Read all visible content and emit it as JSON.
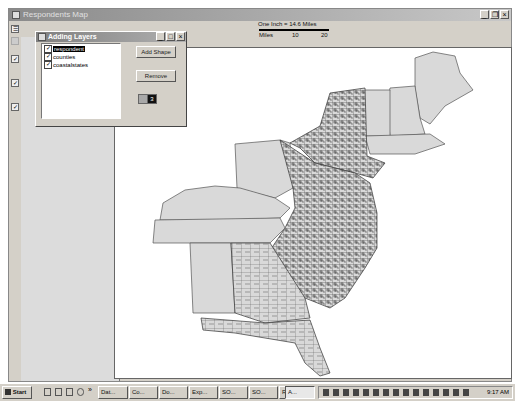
{
  "main_window": {
    "title": "Respondents Map",
    "controls": {
      "minimize": "_",
      "restore": "❐",
      "close": "×"
    }
  },
  "scale_bar": {
    "title": "One Inch = 14.6 Miles",
    "unit_label": "Miles",
    "ticks": [
      "10",
      "20"
    ]
  },
  "dialog": {
    "title": "Adding Layers",
    "controls": {
      "minimize": "_",
      "maximize": "□",
      "close": "×"
    },
    "layers": [
      {
        "label": "respondent",
        "checked": true,
        "selected": true
      },
      {
        "label": "counties",
        "checked": true,
        "selected": false
      },
      {
        "label": "coastalstates",
        "checked": true,
        "selected": false
      }
    ],
    "add_shape_label": "Add Shape",
    "remove_label": "Remove",
    "color_swatch_value": "3"
  },
  "map": {
    "description": "Eastern United States map showing coastal states with county boundaries and respondent point markers",
    "fill_color": "#d9d9d9",
    "outline_color": "#555555"
  },
  "taskbar": {
    "start_label": "Start",
    "quick_launch_overflow": "»",
    "buttons": [
      {
        "label": "Dat..."
      },
      {
        "label": "Co..."
      },
      {
        "label": "Do..."
      },
      {
        "label": "Exp..."
      },
      {
        "label": "SO..."
      },
      {
        "label": "SO..."
      },
      {
        "label": "Re..."
      },
      {
        "label": "A...",
        "active": true
      }
    ],
    "clock": "9:17 AM"
  }
}
